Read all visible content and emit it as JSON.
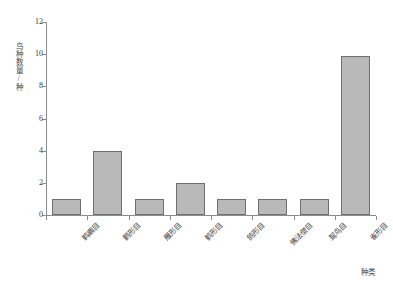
{
  "chart_data": {
    "type": "bar",
    "title": "",
    "xlabel": "种类",
    "ylabel": "鸟种数量/种",
    "categories": [
      "鹈鹕目",
      "鹳形目",
      "雁形目",
      "鹤形目",
      "鸽形目",
      "佛法僧目",
      "䴕鸟目",
      "雀形目"
    ],
    "values": [
      1,
      4,
      1,
      2,
      1,
      1,
      1,
      9.9
    ],
    "ylim": [
      0,
      12
    ],
    "yticks": [
      0,
      2,
      4,
      6,
      8,
      10,
      12
    ],
    "ytick_labels": [
      "0",
      "2",
      "4",
      "6",
      "8",
      "10",
      "12"
    ],
    "grid": false,
    "legend": null,
    "bar_fill_color": "#b9b9b9",
    "bar_edge_color": "#6f6f6f",
    "axis_color": "#8d8d8d"
  }
}
